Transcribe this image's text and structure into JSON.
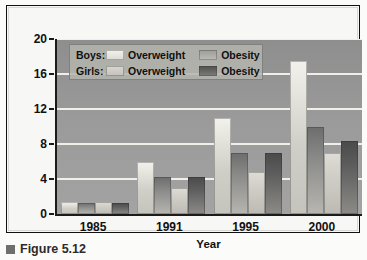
{
  "figure": {
    "caption_marker": "square-marker",
    "caption_text": "Figure 5.12"
  },
  "legend": {
    "rows": [
      {
        "series_label": "Boys:",
        "light_label": "Overweight",
        "dark_label": "Obesity"
      },
      {
        "series_label": "Girls:",
        "light_label": "Overweight",
        "dark_label": "Obesity"
      }
    ]
  },
  "axes": {
    "y_title": "Percentage of 7- to 18-Year-Olds",
    "x_title": "Year",
    "y_ticks": [
      "0",
      "4",
      "8",
      "12",
      "16",
      "20"
    ],
    "x_ticks": [
      "1985",
      "1991",
      "1995",
      "2000"
    ]
  },
  "chart_data": {
    "type": "bar",
    "title": "",
    "subtitle": "",
    "xlabel": "Year",
    "ylabel": "Percentage of 7- to 18-Year-Olds",
    "categories": [
      "1985",
      "1991",
      "1995",
      "2000"
    ],
    "ylim": [
      0,
      20
    ],
    "ytick_values": [
      0,
      4,
      8,
      12,
      16,
      20
    ],
    "grid": true,
    "grid_axis": "y",
    "legend_position": "upper-left-inside",
    "series": [
      {
        "name": "Boys: Overweight",
        "key": "boys_overweight",
        "color": "#e7e6df",
        "values": [
          1.4,
          6.0,
          11.0,
          17.5
        ]
      },
      {
        "name": "Boys: Obesity",
        "key": "boys_obesity",
        "color": "#8d8d8c",
        "values": [
          1.3,
          4.2,
          7.0,
          10.0
        ]
      },
      {
        "name": "Girls: Overweight",
        "key": "girls_overweight",
        "color": "#cfcdc5",
        "values": [
          1.4,
          3.0,
          4.8,
          7.0
        ]
      },
      {
        "name": "Girls: Obesity",
        "key": "girls_obesity",
        "color": "#5e5e5e",
        "values": [
          1.3,
          4.2,
          7.0,
          8.3
        ]
      }
    ]
  }
}
